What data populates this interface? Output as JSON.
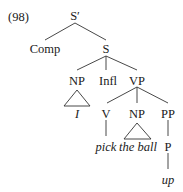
{
  "example_number": "(98)",
  "tree": {
    "root": "S′",
    "nodes": {
      "s_bar": "S′",
      "comp": "Comp",
      "s": "S",
      "np_subj": "NP",
      "infl": "Infl",
      "vp": "VP",
      "subj_word": "I",
      "v": "V",
      "np_obj": "NP",
      "pp": "PP",
      "verb_word": "pick",
      "obj_words": "the ball",
      "p": "P",
      "prep_word": "up"
    }
  },
  "colors": {
    "ink": "#1a1a1a",
    "background": "#ffffff"
  }
}
